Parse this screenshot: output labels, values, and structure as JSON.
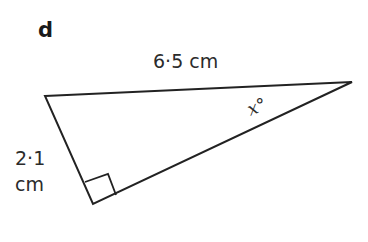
{
  "part_label": "d",
  "triangle": {
    "vertices": {
      "top_left": [
        45,
        96
      ],
      "right": [
        352,
        82
      ],
      "right_angle": [
        93,
        204
      ]
    },
    "right_angle_marker": [
      [
        85,
        182
      ],
      [
        108,
        174
      ],
      [
        116,
        195
      ]
    ],
    "stroke_color": "#222222"
  },
  "labels": {
    "hypotenuse": "6·5 cm",
    "short_side_value": "2·1",
    "short_side_unit": "cm",
    "angle": "x°"
  }
}
